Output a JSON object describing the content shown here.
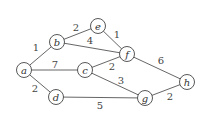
{
  "graph": {
    "nodes": [
      {
        "id": "a",
        "label": "a",
        "x": 24,
        "y": 70
      },
      {
        "id": "b",
        "label": "b",
        "x": 57,
        "y": 42
      },
      {
        "id": "e",
        "label": "e",
        "x": 98,
        "y": 26
      },
      {
        "id": "c",
        "label": "c",
        "x": 85,
        "y": 70
      },
      {
        "id": "f",
        "label": "f",
        "x": 127,
        "y": 54
      },
      {
        "id": "d",
        "label": "d",
        "x": 56,
        "y": 97
      },
      {
        "id": "g",
        "label": "g",
        "x": 145,
        "y": 98
      },
      {
        "id": "h",
        "label": "h",
        "x": 187,
        "y": 82
      }
    ],
    "edges": [
      {
        "from": "a",
        "to": "b",
        "weight": "1",
        "lx": 36,
        "ly": 51
      },
      {
        "from": "b",
        "to": "e",
        "weight": "2",
        "lx": 76,
        "ly": 31
      },
      {
        "from": "b",
        "to": "f",
        "weight": "4",
        "lx": 90,
        "ly": 44
      },
      {
        "from": "e",
        "to": "f",
        "weight": "1",
        "lx": 117,
        "ly": 38
      },
      {
        "from": "a",
        "to": "c",
        "weight": "7",
        "lx": 55,
        "ly": 68
      },
      {
        "from": "c",
        "to": "f",
        "weight": "2",
        "lx": 112,
        "ly": 70
      },
      {
        "from": "c",
        "to": "g",
        "weight": "3",
        "lx": 121,
        "ly": 84
      },
      {
        "from": "a",
        "to": "d",
        "weight": "2",
        "lx": 35,
        "ly": 92
      },
      {
        "from": "d",
        "to": "g",
        "weight": "5",
        "lx": 100,
        "ly": 109
      },
      {
        "from": "f",
        "to": "h",
        "weight": "6",
        "lx": 161,
        "ly": 64
      },
      {
        "from": "g",
        "to": "h",
        "weight": "2",
        "lx": 170,
        "ly": 100
      }
    ]
  }
}
